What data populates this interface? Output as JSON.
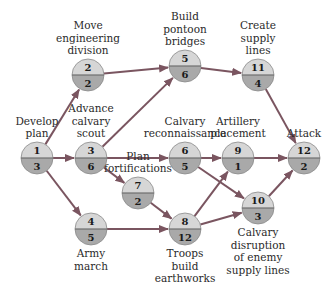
{
  "colors": {
    "node_top": "#d6d6d6",
    "node_bottom": "#a9a9a9",
    "node_rim": "#8a8a8a",
    "arrow": "#7a5560",
    "text": "#2a2a2a"
  },
  "nodes": [
    {
      "id": "n1",
      "task": "1",
      "duration": "3",
      "label": [
        "Develop",
        "plan"
      ],
      "x": 37,
      "y": 158,
      "label_pos": "above"
    },
    {
      "id": "n2",
      "task": "2",
      "duration": "2",
      "label": [
        "Move",
        "engineering",
        "division"
      ],
      "x": 88,
      "y": 75,
      "label_pos": "above"
    },
    {
      "id": "n3",
      "task": "3",
      "duration": "6",
      "label": [
        "Advance",
        "calvary",
        "scout"
      ],
      "x": 91,
      "y": 158,
      "label_pos": "above"
    },
    {
      "id": "n4",
      "task": "4",
      "duration": "5",
      "label": [
        "Army",
        "march"
      ],
      "x": 91,
      "y": 229,
      "label_pos": "below"
    },
    {
      "id": "n5",
      "task": "5",
      "duration": "6",
      "label": [
        "Build",
        "pontoon",
        "bridges"
      ],
      "x": 185,
      "y": 66,
      "label_pos": "above"
    },
    {
      "id": "n6",
      "task": "6",
      "duration": "5",
      "label": [
        "Calvary",
        "reconnaissance"
      ],
      "x": 185,
      "y": 158,
      "label_pos": "above"
    },
    {
      "id": "n7",
      "task": "7",
      "duration": "2",
      "label": [
        "Plan",
        "fortifications"
      ],
      "x": 138,
      "y": 193,
      "label_pos": "above"
    },
    {
      "id": "n8",
      "task": "8",
      "duration": "12",
      "label": [
        "Troops",
        "build",
        "earthworks"
      ],
      "x": 185,
      "y": 229,
      "label_pos": "below"
    },
    {
      "id": "n9",
      "task": "9",
      "duration": "1",
      "label": [
        "Artillery",
        "placement"
      ],
      "x": 238,
      "y": 158,
      "label_pos": "above"
    },
    {
      "id": "n10",
      "task": "10",
      "duration": "3",
      "label": [
        "Calvary",
        "disruption",
        "of enemy",
        "supply lines"
      ],
      "x": 258,
      "y": 208,
      "label_pos": "below"
    },
    {
      "id": "n11",
      "task": "11",
      "duration": "4",
      "label": [
        "Create",
        "supply",
        "lines"
      ],
      "x": 258,
      "y": 75,
      "label_pos": "above"
    },
    {
      "id": "n12",
      "task": "12",
      "duration": "2",
      "label": [
        "Attack"
      ],
      "x": 304,
      "y": 158,
      "label_pos": "above"
    }
  ],
  "edges": [
    {
      "from": "n1",
      "to": "n2"
    },
    {
      "from": "n1",
      "to": "n3"
    },
    {
      "from": "n1",
      "to": "n4"
    },
    {
      "from": "n2",
      "to": "n5"
    },
    {
      "from": "n3",
      "to": "n5"
    },
    {
      "from": "n3",
      "to": "n6"
    },
    {
      "from": "n3",
      "to": "n7"
    },
    {
      "from": "n4",
      "to": "n8"
    },
    {
      "from": "n7",
      "to": "n8"
    },
    {
      "from": "n5",
      "to": "n11"
    },
    {
      "from": "n6",
      "to": "n9"
    },
    {
      "from": "n6",
      "to": "n10"
    },
    {
      "from": "n8",
      "to": "n9"
    },
    {
      "from": "n8",
      "to": "n10"
    },
    {
      "from": "n9",
      "to": "n12"
    },
    {
      "from": "n10",
      "to": "n12"
    },
    {
      "from": "n11",
      "to": "n12"
    }
  ]
}
